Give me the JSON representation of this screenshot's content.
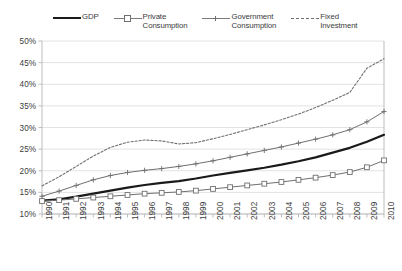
{
  "legend": {
    "position": "top",
    "items": [
      {
        "label": "GDP",
        "style": "thick-solid-black",
        "marker": "none"
      },
      {
        "label": "Private\nConsumption",
        "style": "thin-solid-gray",
        "marker": "open-square"
      },
      {
        "label": "Government\nConsumption",
        "style": "thin-solid-gray",
        "marker": "cross"
      },
      {
        "label": "Fixed\nInvestment",
        "style": "dashed-gray",
        "marker": "none"
      }
    ]
  },
  "colors": {
    "gdp": "#1a1a1a",
    "private_consumption": "#6f6f6f",
    "government_consumption": "#6f6f6f",
    "fixed_investment": "#6f6f6f",
    "grid": "#e2e2e2",
    "axis": "#bdbdbd",
    "text": "#3d3d3d"
  },
  "chart_data": {
    "type": "line",
    "title": "",
    "xlabel": "",
    "ylabel": "",
    "grid": true,
    "legend_position": "top",
    "ylim": [
      10,
      50
    ],
    "ytick_step": 5,
    "ytick_labels": [
      "10%",
      "15%",
      "20%",
      "25%",
      "30%",
      "35%",
      "40%",
      "45%",
      "50%"
    ],
    "ytick_values": [
      10,
      15,
      20,
      25,
      30,
      35,
      40,
      45,
      50
    ],
    "categories": [
      "1990",
      "1991",
      "1992",
      "1993",
      "1994",
      "1995",
      "1996",
      "1997",
      "1998",
      "1999",
      "2000",
      "2001",
      "2002",
      "2003",
      "2004",
      "2005",
      "2006",
      "2007",
      "2008",
      "2009",
      "2010"
    ],
    "series": [
      {
        "name": "GDP",
        "marker": "none",
        "dash": false,
        "width": 2.2,
        "color": "#1a1a1a",
        "values": [
          13.1,
          13.4,
          14.0,
          14.7,
          15.4,
          16.1,
          16.7,
          17.2,
          17.6,
          18.2,
          18.9,
          19.5,
          20.1,
          20.7,
          21.4,
          22.2,
          23.1,
          24.2,
          25.3,
          26.7,
          28.3
        ]
      },
      {
        "name": "Private Consumption",
        "marker": "open-square",
        "dash": false,
        "width": 1.0,
        "color": "#6f6f6f",
        "values": [
          13.0,
          13.2,
          13.5,
          13.8,
          14.1,
          14.4,
          14.7,
          14.9,
          15.1,
          15.4,
          15.8,
          16.2,
          16.6,
          17.0,
          17.4,
          17.9,
          18.4,
          19.0,
          19.7,
          20.8,
          22.4
        ]
      },
      {
        "name": "Government Consumption",
        "marker": "cross",
        "dash": false,
        "width": 1.0,
        "color": "#6f6f6f",
        "values": [
          14.1,
          15.3,
          16.6,
          17.9,
          18.9,
          19.6,
          20.1,
          20.5,
          21.0,
          21.6,
          22.3,
          23.1,
          23.9,
          24.7,
          25.5,
          26.4,
          27.3,
          28.3,
          29.5,
          31.3,
          33.7
        ]
      },
      {
        "name": "Fixed Investment",
        "marker": "none",
        "dash": true,
        "width": 1.1,
        "color": "#6f6f6f",
        "values": [
          16.5,
          18.6,
          21.0,
          23.4,
          25.4,
          26.6,
          27.1,
          26.9,
          26.2,
          26.5,
          27.4,
          28.4,
          29.5,
          30.6,
          31.8,
          33.1,
          34.6,
          36.3,
          38.1,
          43.7,
          45.9
        ]
      }
    ]
  }
}
